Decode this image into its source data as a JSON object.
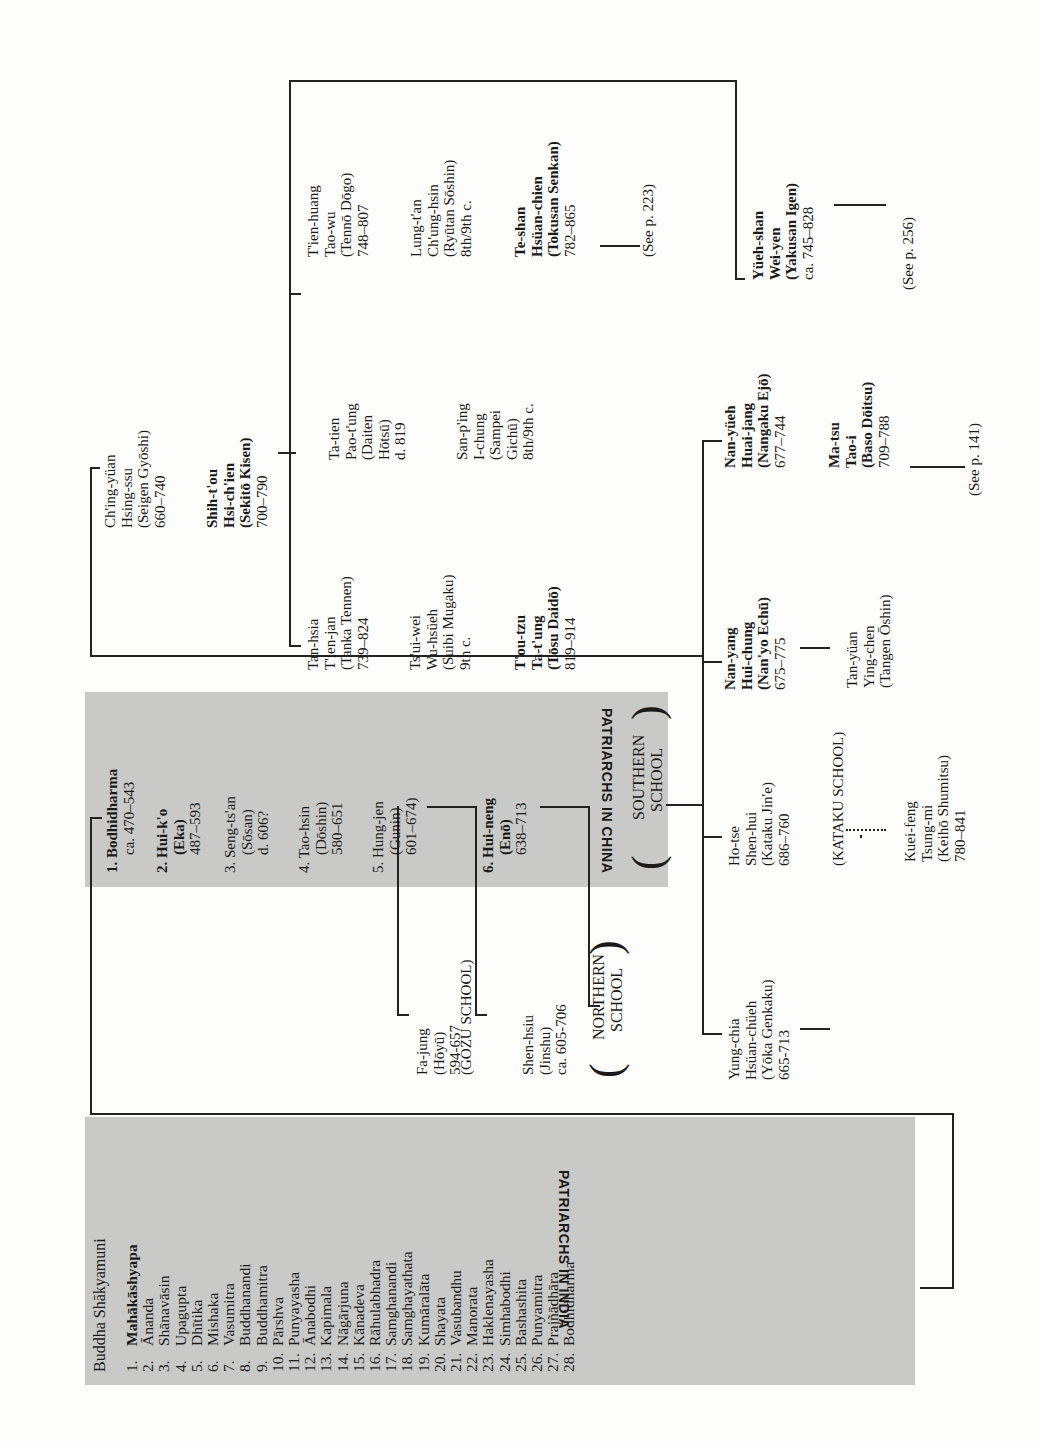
{
  "india": {
    "heading": "PATRIARCHS IN INDIA",
    "root": "Buddha Shākyamuni",
    "patriarchs": [
      {
        "n": "1.",
        "name": "Mahākāshyapa",
        "bold": true
      },
      {
        "n": "2.",
        "name": "Ānanda"
      },
      {
        "n": "3.",
        "name": "Shānavāsin"
      },
      {
        "n": "4.",
        "name": "Upagupta"
      },
      {
        "n": "5.",
        "name": "Dhītika"
      },
      {
        "n": "6.",
        "name": "Mishaka"
      },
      {
        "n": "7.",
        "name": "Vasumitra"
      },
      {
        "n": "8.",
        "name": "Buddhanandi"
      },
      {
        "n": "9.",
        "name": "Buddhamitra"
      },
      {
        "n": "10.",
        "name": "Pārshva"
      },
      {
        "n": "11.",
        "name": "Punyayasha"
      },
      {
        "n": "12.",
        "name": "Ānabodhi"
      },
      {
        "n": "13.",
        "name": "Kapimala"
      },
      {
        "n": "14.",
        "name": "Nāgārjuna"
      },
      {
        "n": "15.",
        "name": "Kānadeva"
      },
      {
        "n": "16.",
        "name": "Rāhulabhadra"
      },
      {
        "n": "17.",
        "name": "Samghanandi"
      },
      {
        "n": "18.",
        "name": "Samghayathata"
      },
      {
        "n": "19.",
        "name": "Kumāralāta"
      },
      {
        "n": "20.",
        "name": "Shayata"
      },
      {
        "n": "21.",
        "name": "Vasubandhu"
      },
      {
        "n": "22.",
        "name": "Manorata"
      },
      {
        "n": "23.",
        "name": "Haklenayasha"
      },
      {
        "n": "24.",
        "name": "Simhabodhi"
      },
      {
        "n": "25.",
        "name": "Bashashita"
      },
      {
        "n": "26.",
        "name": "Punyamitra"
      },
      {
        "n": "27.",
        "name": "Prajñādhāra"
      },
      {
        "n": "28.",
        "name": "Bodhidharma"
      }
    ]
  },
  "china": {
    "heading": "PATRIARCHS IN CHINA",
    "patriarchs": [
      {
        "lines": [
          "1. Bodhidharma",
          "ca. 470–543"
        ]
      },
      {
        "lines": [
          "2. Hui-k'o",
          "(Eka)",
          "487–593"
        ]
      },
      {
        "lines": [
          "3. Seng-ts'an",
          "(Sōsan)",
          "d. 606?"
        ]
      },
      {
        "lines": [
          "4. Tao-hsin",
          "(Dōshin)",
          "580–651"
        ]
      },
      {
        "lines": [
          "5. Hung-jen",
          "(Gunin)",
          "601–674)"
        ]
      },
      {
        "lines": [
          "6. Hui-neng",
          "(Enō)",
          "638–713"
        ]
      }
    ],
    "southern_school": [
      "SOUTHERN",
      "SCHOOL"
    ]
  },
  "branches": {
    "fa_jung": [
      "Fa-jung",
      "(Hōyū)",
      "594-657"
    ],
    "gozu_school": "(GOZU SCHOOL)",
    "shen_hsiu": [
      "Shen-hsiu",
      "(Jinshu)",
      "ca. 605-706"
    ],
    "northern_school": [
      "NORTHERN",
      "SCHOOL"
    ],
    "yung_chia": [
      "Yung-chia",
      "Hsüan-chüeh",
      "(Yōka Genkaku)",
      "665-713"
    ],
    "ho_tse": [
      "Ho-tse",
      "Shen-hui",
      "(Kataku Jin'e)",
      "686–760"
    ],
    "kataku_school": "(KATAKU SCHOOL)",
    "kuei_feng": [
      "Kuei-feng",
      "Tsung-mi",
      "(Keihō Shumitsu)",
      "780–841"
    ],
    "nan_yang": [
      "Nan-yang",
      "Hui-chung",
      "(Nan'yo Echū)",
      "675–775"
    ],
    "tan_yuan": [
      "Tan-yüan",
      "Ying-chen",
      "(Tangen Ōshin)"
    ],
    "nan_yueh": [
      "Nan-yüeh",
      "Huai-jang",
      "(Nangaku Ejō)",
      "677–744"
    ],
    "ma_tsu": [
      "Ma-tsu",
      "Tao-i",
      "(Baso Dōitsu)",
      "709–788"
    ],
    "see_141": "(See p. 141)",
    "ching_yuan": [
      "Ch'ing-yüan",
      "Hsing-ssu",
      "(Seigen Gyōshi)",
      "660–740"
    ],
    "shih_tou": [
      "Shih-t'ou",
      "Hsi-ch'ien",
      "(Sekitō Kisen)",
      "700–790"
    ],
    "tan_hsia": [
      "Tan-hsia",
      "T'ien-jan",
      "(Tanka Tennen)",
      "739–824"
    ],
    "tsui_wei": [
      "Ts'ui-wei",
      "Wu-hsüeh",
      "(Suibi Mugaku)",
      "9th c."
    ],
    "tou_tzu": [
      "T'ou-tzu",
      "Ta-t'ung",
      "(Tōsu Daidō)",
      "819–914"
    ],
    "ta_tien": [
      "Ta-tien",
      "Pao-t'ung",
      "(Daiten",
      "Hōtsū)",
      "d. 819"
    ],
    "san_ping": [
      "San-p'ing",
      "I-chung",
      "(Sampei",
      "Gichū)",
      "8th/9th c."
    ],
    "tien_huang": [
      "T'ien-huang",
      "Tao-wu",
      "(Tennō Dōgo)",
      "748–807"
    ],
    "lung_tan": [
      "Lung-t'an",
      "Ch'ung-hsin",
      "(Ryūtan Sōshin)",
      "8th/9th c."
    ],
    "te_shan": [
      "Te-shan",
      "Hsüan-chien",
      "(Tokusan Senkan)",
      "782–865"
    ],
    "see_223": "(See p. 223)",
    "yueh_shan": [
      "Yüeh-shan",
      "Wei-yen",
      "(Yakusan Igen)",
      "ca. 745–828"
    ],
    "see_256": "(See p. 256)"
  },
  "colors": {
    "box_gray": "#c9c9c7",
    "line": "#222222",
    "paper": "#fdfdfb"
  }
}
